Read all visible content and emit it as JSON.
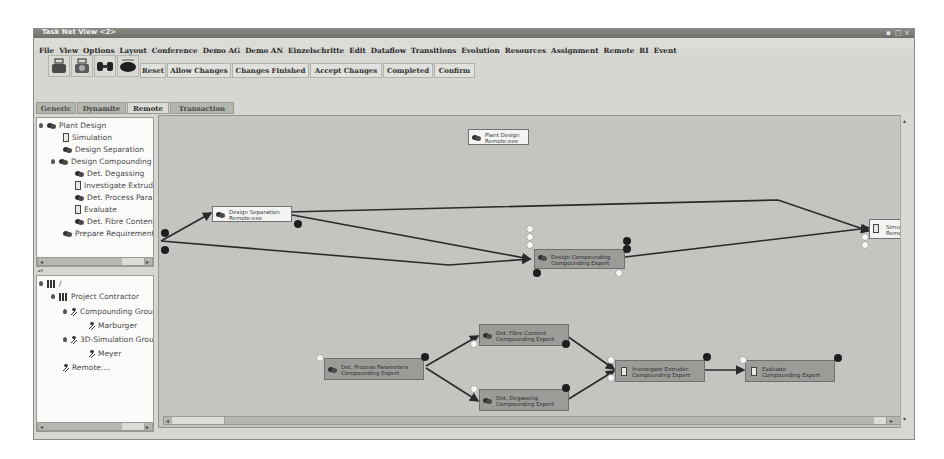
{
  "window": {
    "title": "Task Net View <2>",
    "controls": [
      "minimize",
      "maximize",
      "close"
    ]
  },
  "menubar": {
    "items": [
      "File",
      "View",
      "Options",
      "Layout",
      "Conference",
      "Demo AG",
      "Demo AN",
      "Einzelschritte",
      "Edit",
      "Dataflow",
      "Transitions",
      "Evolution",
      "Resources",
      "Assignment",
      "Remote",
      "RI",
      "Event"
    ]
  },
  "toolbar": {
    "icon_buttons": [
      "task-net-icon-1",
      "task-net-icon-2",
      "link-icon",
      "remote-icon"
    ],
    "buttons": [
      "Reset",
      "Allow Changes",
      "Changes Finished",
      "Accept Changes",
      "Completed",
      "Confirm"
    ]
  },
  "tabs": [
    {
      "label": "Generic",
      "active": false
    },
    {
      "label": "Dynamite",
      "active": false
    },
    {
      "label": "Remote",
      "active": true
    },
    {
      "label": "Transaction",
      "active": false
    }
  ],
  "task_tree": [
    {
      "label": "Plant Design",
      "icon": "gear",
      "level": 0,
      "expander": true
    },
    {
      "label": "Simulation",
      "icon": "doc",
      "level": 1
    },
    {
      "label": "Design Separation",
      "icon": "gear",
      "level": 1
    },
    {
      "label": "Design Compounding",
      "icon": "gear",
      "level": 1,
      "expander": true
    },
    {
      "label": "Det. Degassing",
      "icon": "gear",
      "level": 2
    },
    {
      "label": "Investigate Extruder",
      "icon": "doc",
      "level": 2
    },
    {
      "label": "Det. Process Parameters",
      "icon": "gear",
      "level": 2
    },
    {
      "label": "Evaluate",
      "icon": "doc",
      "level": 2
    },
    {
      "label": "Det. Fibre Content",
      "icon": "gear",
      "level": 2
    },
    {
      "label": "Prepare Requirements",
      "icon": "gear",
      "level": 1
    }
  ],
  "org_tree": [
    {
      "label": "/",
      "icon": "org",
      "level": 0,
      "expander": true
    },
    {
      "label": "Project Contractor",
      "icon": "org",
      "level": 1,
      "expander": true
    },
    {
      "label": "Compounding Group",
      "icon": "role",
      "level": 2,
      "expander": true
    },
    {
      "label": "Marburger",
      "icon": "person",
      "level": 3
    },
    {
      "label": "3D-Simulation Group",
      "icon": "role",
      "level": 2,
      "expander": true
    },
    {
      "label": "Meyer",
      "icon": "person",
      "level": 3
    },
    {
      "label": "Remote:...",
      "icon": "role",
      "level": 1
    }
  ],
  "canvas": {
    "nodes": [
      {
        "id": "plant",
        "line1": "Plant Design",
        "line2": "Remote:eee",
        "style": "white",
        "icon": "gear"
      },
      {
        "id": "sep",
        "line1": "Design Separation",
        "line2": "Remote:eee",
        "style": "white",
        "icon": "gear"
      },
      {
        "id": "comp",
        "line1": "Design Compounding",
        "line2": "Compounding Expert",
        "style": "dark",
        "icon": "gear"
      },
      {
        "id": "sim",
        "line1": "Simulation",
        "line2": "Remote",
        "style": "white",
        "icon": "doc"
      },
      {
        "id": "proc",
        "line1": "Det. Process Parameters",
        "line2": "Compounding Expert",
        "style": "dark",
        "icon": "gear"
      },
      {
        "id": "fibre",
        "line1": "Det. Fibre Content",
        "line2": "Compounding Expert",
        "style": "dark",
        "icon": "gear"
      },
      {
        "id": "degas",
        "line1": "Det. Degassing",
        "line2": "Compounding Expert",
        "style": "dark",
        "icon": "gear"
      },
      {
        "id": "invest",
        "line1": "Investigate Extruder",
        "line2": "Compounding Expert",
        "style": "dark",
        "icon": "doc"
      },
      {
        "id": "eval",
        "line1": "Evaluate",
        "line2": "Compounding Expert",
        "style": "dark",
        "icon": "doc"
      }
    ]
  },
  "colors": {
    "canvas_bg": "#c4c4c1",
    "node_dark": "#9b9b98",
    "node_white": "#f4f4f2",
    "edge": "#2a2a2a",
    "titlebar": "#7a7a76"
  }
}
